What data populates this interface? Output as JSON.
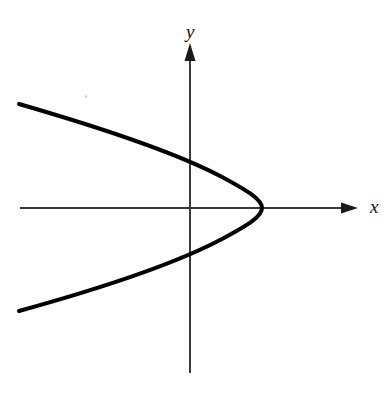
{
  "figure": {
    "background_color": "#ffffff",
    "width": 384,
    "height": 393
  },
  "axes": {
    "x_axis": {
      "label": "x",
      "label_position": {
        "x": 370,
        "y": 213
      },
      "color": "#3a3a3a",
      "stroke_width": 1.6,
      "start": {
        "x": 20,
        "y": 208
      },
      "end": {
        "x": 352,
        "y": 208
      },
      "arrow_tip": {
        "x": 358,
        "y": 208
      },
      "arrow": "right"
    },
    "y_axis": {
      "label": "y",
      "label_position": {
        "x": 186,
        "y": 38
      },
      "color": "#3a3a3a",
      "stroke_width": 1.6,
      "start": {
        "x": 190,
        "y": 373
      },
      "end": {
        "x": 190,
        "y": 50
      },
      "arrow_tip": {
        "x": 190,
        "y": 43
      },
      "arrow": "up"
    },
    "origin": {
      "x": 190,
      "y": 208
    }
  },
  "chart_data": {
    "type": "line",
    "title": "",
    "xlabel": "x",
    "ylabel": "y",
    "grid": false,
    "legend": null,
    "curve_name": "parabola-leftward",
    "curve_color": "#000000",
    "curve_stroke_width": 4,
    "vertex_pixel": {
      "x": 262,
      "y": 208
    },
    "y_axis_crossings_pixel": [
      157,
      259
    ],
    "endpoints_pixel": [
      {
        "x": 19,
        "y": 104
      },
      {
        "x": 19,
        "y": 311
      }
    ],
    "path_points_pixel": [
      {
        "x": 19,
        "y": 104
      },
      {
        "x": 60,
        "y": 117
      },
      {
        "x": 100,
        "y": 128
      },
      {
        "x": 140,
        "y": 142
      },
      {
        "x": 180,
        "y": 155
      },
      {
        "x": 200,
        "y": 163
      },
      {
        "x": 215,
        "y": 172
      },
      {
        "x": 230,
        "y": 181
      },
      {
        "x": 243,
        "y": 189
      },
      {
        "x": 252,
        "y": 196
      },
      {
        "x": 258,
        "y": 201
      },
      {
        "x": 261,
        "y": 205
      },
      {
        "x": 262,
        "y": 208
      },
      {
        "x": 261,
        "y": 211
      },
      {
        "x": 258,
        "y": 215
      },
      {
        "x": 252,
        "y": 220
      },
      {
        "x": 243,
        "y": 227
      },
      {
        "x": 230,
        "y": 235
      },
      {
        "x": 215,
        "y": 244
      },
      {
        "x": 200,
        "y": 253
      },
      {
        "x": 180,
        "y": 261
      },
      {
        "x": 140,
        "y": 274
      },
      {
        "x": 100,
        "y": 288
      },
      {
        "x": 60,
        "y": 299
      },
      {
        "x": 19,
        "y": 311
      }
    ],
    "path_svg": "M 19,104 C 95,126 175,152 222,177 C 250,192 262,200 262,208 C 262,216 250,224 222,239 C 175,264 95,290 19,311",
    "axis_ranges": {
      "x_pixel": [
        19,
        358
      ],
      "y_pixel": [
        43,
        373
      ]
    }
  },
  "artifacts": {
    "speck": {
      "x": 85,
      "y": 95,
      "color": "#c9c9c9"
    }
  }
}
